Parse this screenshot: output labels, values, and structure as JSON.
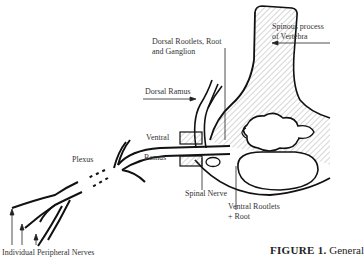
{
  "figure": {
    "caption_label": "FIGURE 1.",
    "caption_text": " General",
    "labels": {
      "spinous_process_line1": "Spinous process",
      "spinous_process_line2": "of Vertebra",
      "dorsal_rootlets_line1": "Dorsal Rootlets, Root",
      "dorsal_rootlets_line2": "and Ganglion",
      "dorsal_ramus": "Dorsal Ramus",
      "ventral": "Ventral",
      "ramus": "Ramus",
      "plexus": "Plexus",
      "spinal_nerve": "Spinal Nerve",
      "ventral_rootlets_line1": "Ventral Rootlets",
      "ventral_rootlets_line2": "+ Root",
      "individual_peripheral_nerves": "Individual Peripheral Nerves"
    },
    "colors": {
      "ink": "#111111",
      "background": "#ffffff",
      "hatch": "#777777"
    }
  }
}
